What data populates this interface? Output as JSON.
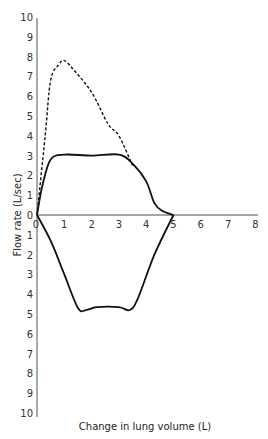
{
  "chart_data": {
    "type": "line",
    "title": "",
    "xlabel": "Change in lung volume (L)",
    "ylabel": "Flow rate (L/sec)",
    "xlim": [
      0,
      8
    ],
    "ylim_top": [
      0,
      10
    ],
    "ylim_bottom": [
      0,
      10
    ],
    "x_ticks": [
      "0",
      "1",
      "2",
      "3",
      "4",
      "5",
      "6",
      "7",
      "8"
    ],
    "y_ticks_upper": [
      "0",
      "1",
      "2",
      "3",
      "4",
      "5",
      "6",
      "7",
      "8",
      "9",
      "10"
    ],
    "y_ticks_lower": [
      "1",
      "2",
      "3",
      "4",
      "5",
      "6",
      "7",
      "8",
      "9",
      "10"
    ],
    "grid": false,
    "series": [
      {
        "name": "Maximal expiratory flow (dashed)",
        "style": "dashed",
        "points": [
          [
            0,
            0
          ],
          [
            0.3,
            4
          ],
          [
            0.5,
            6.8
          ],
          [
            0.8,
            7.6
          ],
          [
            1.0,
            7.8
          ],
          [
            1.3,
            7.4
          ],
          [
            2.0,
            6.2
          ],
          [
            2.6,
            4.6
          ],
          [
            3.0,
            4.0
          ],
          [
            3.5,
            2.5
          ]
        ]
      },
      {
        "name": "Expiratory flow (solid)",
        "style": "solid",
        "points": [
          [
            0,
            0
          ],
          [
            0.2,
            1.5
          ],
          [
            0.5,
            2.8
          ],
          [
            1.0,
            3.05
          ],
          [
            2.0,
            3.0
          ],
          [
            3.0,
            3.05
          ],
          [
            3.5,
            2.6
          ],
          [
            4.0,
            1.7
          ],
          [
            4.3,
            0.6
          ],
          [
            4.6,
            0.2
          ],
          [
            5.0,
            0
          ]
        ]
      },
      {
        "name": "Inspiratory flow (solid)",
        "style": "solid",
        "points": [
          [
            0,
            0
          ],
          [
            0.5,
            -1.3
          ],
          [
            1.0,
            -3.0
          ],
          [
            1.5,
            -4.7
          ],
          [
            1.8,
            -4.8
          ],
          [
            2.2,
            -4.65
          ],
          [
            3.0,
            -4.65
          ],
          [
            3.4,
            -4.8
          ],
          [
            3.7,
            -4.2
          ],
          [
            4.3,
            -2.0
          ],
          [
            5.0,
            0
          ]
        ]
      }
    ]
  }
}
